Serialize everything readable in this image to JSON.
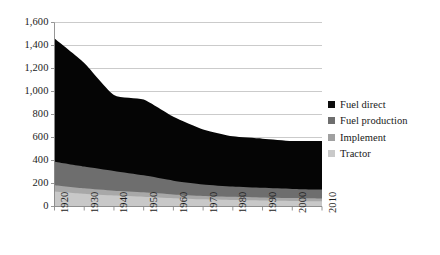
{
  "chart_data": {
    "type": "area",
    "stacked": true,
    "title": "",
    "subtitle": "",
    "xlabel": "",
    "ylabel": "",
    "grid": true,
    "legend_position": "right",
    "x": [
      1920,
      1930,
      1940,
      1950,
      1960,
      1970,
      1980,
      1990,
      2000,
      2010
    ],
    "xtick_labels": [
      "1920",
      "1930",
      "1940",
      "1950",
      "1960",
      "1970",
      "1980",
      "1990",
      "2000",
      "2010"
    ],
    "xlim": [
      1920,
      2010
    ],
    "ytick_labels": [
      "0",
      "200",
      "400",
      "600",
      "800",
      "1,000",
      "1,200",
      "1,400",
      "1,600"
    ],
    "ytick_values": [
      0,
      200,
      400,
      600,
      800,
      1000,
      1200,
      1400,
      1600
    ],
    "ylim": [
      0,
      1600
    ],
    "series": [
      {
        "name": "Tractor",
        "color": "#c8c8c8",
        "values": [
          130,
          110,
          95,
          85,
          72,
          62,
          56,
          52,
          48,
          45
        ]
      },
      {
        "name": "Implement",
        "color": "#a8a8a8",
        "values": [
          55,
          48,
          42,
          38,
          33,
          30,
          28,
          26,
          25,
          24
        ]
      },
      {
        "name": "Fuel production",
        "color": "#6e6e6e",
        "values": [
          205,
          190,
          172,
          148,
          120,
          100,
          90,
          84,
          80,
          78
        ]
      },
      {
        "name": "Fuel direct",
        "color": "#050505",
        "values": [
          1070,
          900,
          661,
          659,
          555,
          478,
          436,
          428,
          417,
          423
        ]
      }
    ],
    "totals": [
      1460,
      1248,
      970,
      930,
      780,
      670,
      610,
      590,
      570,
      570
    ]
  },
  "legend": {
    "items": [
      {
        "label": "Fuel direct",
        "color": "#0d0d0d"
      },
      {
        "label": "Fuel production",
        "color": "#6e6e6e"
      },
      {
        "label": "Implement",
        "color": "#a0a0a0"
      },
      {
        "label": "Tractor",
        "color": "#c9c9c9"
      }
    ]
  },
  "axes": {
    "grid_color": "#c5c5c5",
    "axis_color": "#8a8a8a",
    "text_color": "#1b1b1b"
  }
}
